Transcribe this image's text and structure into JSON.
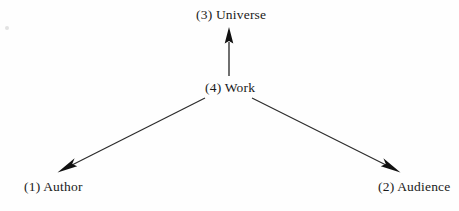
{
  "figure": {
    "background_color": "#fefefe",
    "ink_color": "#1a1a1a"
  },
  "nodes": [
    {
      "id": "author",
      "label": "(1) Author",
      "position": "bottom-left"
    },
    {
      "id": "audience",
      "label": "(2) Audience",
      "position": "bottom-right"
    },
    {
      "id": "universe",
      "label": "(3) Universe",
      "position": "top-center"
    },
    {
      "id": "work",
      "label": "(4) Work",
      "position": "center"
    }
  ],
  "arrows": [
    {
      "id": "work-to-universe",
      "from": "work",
      "to": "universe",
      "direction": "up",
      "arrowhead": "filled-triangle"
    },
    {
      "id": "work-to-author",
      "from": "work",
      "to": "author",
      "direction": "down-left",
      "arrowhead": "filled-triangle"
    },
    {
      "id": "work-to-audience",
      "from": "work",
      "to": "audience",
      "direction": "down-right",
      "arrowhead": "filled-triangle"
    }
  ]
}
